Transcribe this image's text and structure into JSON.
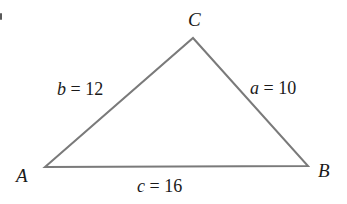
{
  "figure": {
    "type": "geometry-triangle-diagram",
    "background_color": "#ffffff",
    "stroke_color": "#7a7a7a",
    "stroke_width": 2,
    "text_color": "#1a1a1a",
    "width": 347,
    "height": 204,
    "vertices": [
      {
        "name": "A",
        "label": "A",
        "x": 45,
        "y": 167,
        "label_x": 16,
        "label_y": 166
      },
      {
        "name": "B",
        "label": "B",
        "x": 308,
        "y": 166,
        "label_x": 318,
        "label_y": 161
      },
      {
        "name": "C",
        "label": "C",
        "x": 193,
        "y": 38,
        "label_x": 188,
        "label_y": 10
      }
    ],
    "sides": [
      {
        "name": "side-a",
        "variable": "a",
        "separator": " = ",
        "value": "10",
        "text": "a = 10",
        "between": "C-B",
        "label_x": 250,
        "label_y": 79
      },
      {
        "name": "side-b",
        "variable": "b",
        "separator": " = ",
        "value": "12",
        "text": "b = 12",
        "between": "A-C",
        "label_x": 57,
        "label_y": 80
      },
      {
        "name": "side-c",
        "variable": "c",
        "separator": " = ",
        "value": "16",
        "text": "c = 16",
        "between": "A-B",
        "label_x": 137,
        "label_y": 177
      }
    ],
    "artifacts": [
      {
        "name": "edge-speck",
        "x": 0,
        "y": 13,
        "width": 2,
        "height": 7,
        "color": "#3c3c3c"
      }
    ]
  }
}
